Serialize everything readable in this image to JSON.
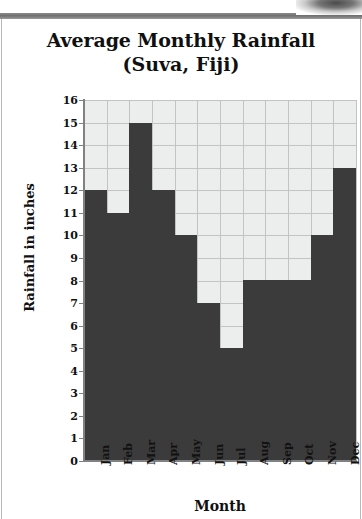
{
  "chart_data": {
    "type": "bar",
    "title": "Average Monthly Rainfall",
    "subtitle": "(Suva, Fiji)",
    "xlabel": "Month",
    "ylabel": "Rainfall in inches",
    "categories": [
      "Jan",
      "Feb",
      "Mar",
      "Apr",
      "May",
      "Jun",
      "Jul",
      "Aug",
      "Sep",
      "Oct",
      "Nov",
      "Dec"
    ],
    "values": [
      12,
      11,
      15,
      12,
      10,
      7,
      5,
      8,
      8,
      8,
      10,
      13
    ],
    "ylim": [
      0,
      16
    ],
    "ytick_labels": [
      "16",
      "15",
      "14",
      "13",
      "12",
      "11",
      "10",
      "9",
      "8",
      "7",
      "6",
      "5",
      "4",
      "3",
      "2",
      "1",
      "0"
    ],
    "ytick_step": 1,
    "grid": true,
    "legend": "none",
    "bar_color": "#3b3b3b",
    "plot_background": "#eceded",
    "gridline_color": "#c2c4c4",
    "axis_color": "#7f8182",
    "text_color": "#111111"
  }
}
